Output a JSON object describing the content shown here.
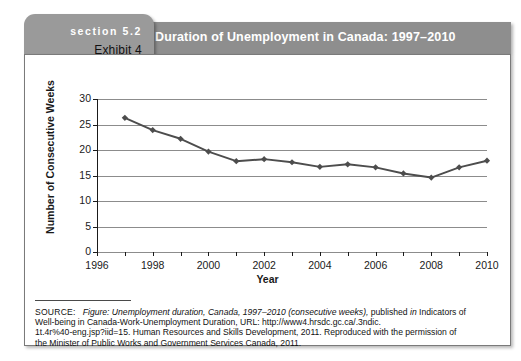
{
  "exhibit": {
    "section_label": "section 5.2",
    "exhibit_label": "Exhibit 4",
    "title": "Duration of Unemployment in Canada: 1997–2010"
  },
  "chart_data": {
    "type": "line",
    "title": "Duration of Unemployment in Canada: 1997–2010",
    "xlabel": "Year",
    "ylabel": "Number of Consecutive Weeks",
    "xlim": [
      1996,
      2010
    ],
    "ylim": [
      0,
      30
    ],
    "ytick_labels": [
      "0",
      "5",
      "10",
      "15",
      "20",
      "25",
      "30"
    ],
    "yticks": [
      0,
      5,
      10,
      15,
      20,
      25,
      30
    ],
    "xtick_labels": [
      "1996",
      "1998",
      "2000",
      "2002",
      "2004",
      "2006",
      "2008",
      "2010"
    ],
    "xticks": [
      1996,
      1998,
      2000,
      2002,
      2004,
      2006,
      2008,
      2010
    ],
    "x": [
      1997,
      1998,
      1999,
      2000,
      2001,
      2002,
      2003,
      2004,
      2005,
      2006,
      2007,
      2008,
      2009,
      2010
    ],
    "values": [
      26.3,
      23.9,
      22.2,
      19.7,
      17.8,
      18.2,
      17.6,
      16.7,
      17.2,
      16.6,
      15.4,
      14.6,
      16.6,
      17.9
    ],
    "series": [
      {
        "name": "Number of Consecutive Weeks",
        "values": [
          26.3,
          23.9,
          22.2,
          19.7,
          17.8,
          18.2,
          17.6,
          16.7,
          17.2,
          16.6,
          15.4,
          14.6,
          16.6,
          17.9
        ]
      }
    ],
    "grid": true,
    "grid_axis": "y",
    "legend": "none",
    "marker": "diamond",
    "line_color": "#4d4d4d",
    "grid_color": "#8c8c8c",
    "axis_color": "#1a1a1a"
  },
  "source": {
    "label": "SOURCE:",
    "line1_italic": "Figure: Unemployment duration, Canada, 1997–2010 (consecutive weeks),",
    "line1_rest": " published",
    "line1_in": " in",
    "line1_tail": " Indicators of",
    "line2": "Well-being in Canada-Work-Unemployment Duration, URL: http://www4.hrsdc.gc.ca/.3ndic.",
    "line3": "1t.4r%40-eng.jsp?iid=15. Human Resources and Skills Development, 2011. Reproduced with the permission of",
    "line4": "the Minister of Public Works and Government Services Canada, 2011."
  },
  "colors": {
    "header_bar": "#8e8e8e",
    "section_tab": "#9a9a9a",
    "title_text": "#ffffff",
    "exhibit_text": "#111111",
    "box_border": "#7a7a7a"
  }
}
